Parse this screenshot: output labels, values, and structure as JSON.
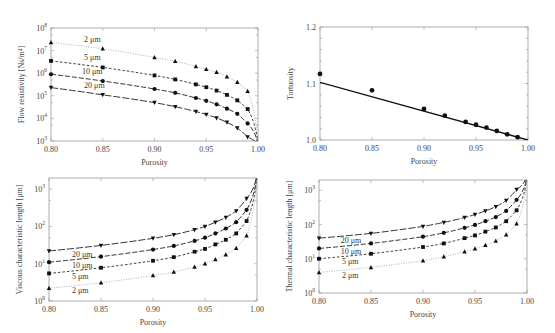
{
  "chart_data": [
    {
      "id": "flow_resistivity",
      "type": "line",
      "scale_y": "log",
      "title": "",
      "xlabel": "Porosity",
      "ylabel": "Flow resistivity [Ns/m⁴]",
      "xlim": [
        0.8,
        1.0
      ],
      "ylim_exp": [
        3,
        8
      ],
      "x_ticks": [
        "0.80",
        "0.85",
        "0.90",
        "0.95",
        "1.00"
      ],
      "y_ticks": [
        "10^3",
        "10^4",
        "10^5",
        "10^6",
        "10^7",
        "10^8"
      ],
      "grid": false,
      "box": {
        "left": 51,
        "top": 28,
        "right": 258,
        "bottom": 141
      },
      "series": [
        {
          "name": "2 μm",
          "marker": "triangle-up",
          "dash": "1,1.5",
          "color": "#aaaaaa",
          "x": [
            0.8,
            0.85,
            0.9,
            0.92,
            0.94,
            0.95,
            0.96,
            0.97,
            0.98,
            0.99
          ],
          "y": [
            23000000.0,
            12000000.0,
            5000000.0,
            3400000.0,
            2000000.0,
            1500000.0,
            1100000.0,
            700000.0,
            400000.0,
            160000.0
          ],
          "label_pos": [
            0.832,
            23000000.0
          ]
        },
        {
          "name": "5 μm",
          "marker": "square",
          "dash": "2.5,2",
          "color": "#333333",
          "x": [
            0.8,
            0.85,
            0.9,
            0.92,
            0.94,
            0.95,
            0.96,
            0.97,
            0.98,
            0.99
          ],
          "y": [
            3500000.0,
            1800000.0,
            800000.0,
            530000.0,
            320000.0,
            240000.0,
            170000.0,
            110000.0,
            63000.0,
            26000.0
          ],
          "label_pos": [
            0.832,
            3700000.0
          ]
        },
        {
          "name": "10 μm",
          "marker": "circle",
          "dash": "5,2",
          "color": "#333333",
          "x": [
            0.8,
            0.85,
            0.9,
            0.92,
            0.94,
            0.95,
            0.96,
            0.97,
            0.98,
            0.99
          ],
          "y": [
            900000.0,
            450000.0,
            200000.0,
            135000.0,
            80000.0,
            60000.0,
            42000.0,
            27000.0,
            16000.0,
            6000.0
          ],
          "label_pos": [
            0.83,
            900000.0
          ]
        },
        {
          "name": "20 μm",
          "marker": "triangle-down",
          "dash": "7,2",
          "color": "#333333",
          "x": [
            0.8,
            0.85,
            0.9,
            0.92,
            0.94,
            0.95,
            0.96,
            0.97,
            0.98,
            0.99
          ],
          "y": [
            230000.0,
            110000.0,
            50000.0,
            33000.0,
            20000.0,
            15000.0,
            10500.0,
            6700.0,
            3800.0,
            1500.0
          ],
          "label_pos": [
            0.832,
            230000.0
          ]
        }
      ]
    },
    {
      "id": "tortuosity",
      "type": "scatter",
      "scale_y": "linear",
      "title": "",
      "xlabel": "Porosity",
      "ylabel": "Tortuosity",
      "xlim": [
        0.8,
        1.0
      ],
      "ylim": [
        1.0,
        1.2
      ],
      "x_ticks": [
        "0.80",
        "0.85",
        "0.90",
        "0.95",
        "1.00"
      ],
      "y_ticks": [
        "1.0",
        "1.1",
        "1.2"
      ],
      "grid": false,
      "box": {
        "left": 320,
        "top": 27,
        "right": 528,
        "bottom": 140
      },
      "series": [
        {
          "name": "Simulation",
          "marker": "circle",
          "x": [
            0.8,
            0.85,
            0.9,
            0.92,
            0.94,
            0.95,
            0.96,
            0.97,
            0.98,
            0.99
          ],
          "y": [
            1.117,
            1.088,
            1.055,
            1.043,
            1.032,
            1.027,
            1.022,
            1.016,
            1.01,
            1.005
          ]
        },
        {
          "name": "Fit",
          "type": "line",
          "x": [
            0.8,
            1.0
          ],
          "y": [
            1.102,
            1.0
          ]
        }
      ]
    },
    {
      "id": "viscous_length",
      "type": "line",
      "scale_y": "log",
      "title": "",
      "xlabel": "Porosity",
      "ylabel": "Viscous characteristic length [μm]",
      "xlim": [
        0.8,
        1.0
      ],
      "ylim_exp": [
        0,
        3.3
      ],
      "x_ticks": [
        "0.80",
        "0.85",
        "0.90",
        "0.95",
        "1.00"
      ],
      "y_ticks": [
        "10^0",
        "10^1",
        "10^2",
        "10^3"
      ],
      "grid": false,
      "box": {
        "left": 49,
        "top": 178,
        "right": 257,
        "bottom": 301
      },
      "series": [
        {
          "name": "20 μm",
          "marker": "triangle-down",
          "dash": "7,2",
          "color": "#333333",
          "x": [
            0.8,
            0.85,
            0.9,
            0.92,
            0.94,
            0.95,
            0.96,
            0.97,
            0.98,
            0.99
          ],
          "y": [
            22,
            31,
            48,
            60,
            82,
            100,
            130,
            175,
            260,
            560
          ],
          "label_pos": [
            0.822,
            15.5
          ]
        },
        {
          "name": "10 μm",
          "marker": "circle",
          "dash": "5,2",
          "color": "#333333",
          "x": [
            0.8,
            0.85,
            0.9,
            0.92,
            0.94,
            0.95,
            0.96,
            0.97,
            0.98,
            0.99
          ],
          "y": [
            11,
            15.5,
            24,
            30,
            41,
            50,
            65,
            88,
            130,
            280
          ],
          "label_pos": [
            0.822,
            7.8
          ]
        },
        {
          "name": "5 μm",
          "marker": "square",
          "dash": "2.5,2",
          "color": "#333333",
          "x": [
            0.8,
            0.85,
            0.9,
            0.92,
            0.94,
            0.95,
            0.96,
            0.97,
            0.98,
            0.99
          ],
          "y": [
            5.5,
            7.8,
            12,
            15,
            21,
            25,
            33,
            44,
            65,
            140
          ],
          "label_pos": [
            0.822,
            3.9
          ]
        },
        {
          "name": "2 μm",
          "marker": "triangle-up",
          "dash": "1,1.5",
          "color": "#aaaaaa",
          "x": [
            0.8,
            0.85,
            0.9,
            0.92,
            0.94,
            0.95,
            0.96,
            0.97,
            0.98,
            0.99
          ],
          "y": [
            2.2,
            3.1,
            4.8,
            6.0,
            8.2,
            10,
            13,
            17.5,
            26,
            56
          ],
          "label_pos": [
            0.822,
            1.6
          ]
        }
      ]
    },
    {
      "id": "thermal_length",
      "type": "line",
      "scale_y": "log",
      "title": "",
      "xlabel": "Porosity",
      "ylabel": "Thermal characteristic length [μm]",
      "xlim": [
        0.8,
        1.0
      ],
      "ylim_exp": [
        0,
        3.3
      ],
      "x_ticks": [
        "0.80",
        "0.85",
        "0.90",
        "0.95",
        "1.00"
      ],
      "y_ticks": [
        "10^0",
        "10^1",
        "10^2",
        "10^3"
      ],
      "grid": false,
      "box": {
        "left": 319,
        "top": 180,
        "right": 527,
        "bottom": 293
      },
      "series": [
        {
          "name": "20 μm",
          "marker": "triangle-down",
          "dash": "7,2",
          "color": "#333333",
          "x": [
            0.8,
            0.85,
            0.9,
            0.92,
            0.94,
            0.95,
            0.96,
            0.97,
            0.98,
            0.99
          ],
          "y": [
            40,
            55,
            88,
            115,
            160,
            195,
            250,
            330,
            500,
            1050
          ],
          "label_pos": [
            0.821,
            28
          ]
        },
        {
          "name": "10 μm",
          "marker": "circle",
          "dash": "5,2",
          "color": "#333333",
          "x": [
            0.8,
            0.85,
            0.9,
            0.92,
            0.94,
            0.95,
            0.96,
            0.97,
            0.98,
            0.99
          ],
          "y": [
            20,
            28,
            44,
            57,
            80,
            97,
            125,
            165,
            250,
            525
          ],
          "label_pos": [
            0.821,
            14
          ]
        },
        {
          "name": "5 μm",
          "marker": "square",
          "dash": "2.5,2",
          "color": "#333333",
          "x": [
            0.8,
            0.85,
            0.9,
            0.92,
            0.94,
            0.95,
            0.96,
            0.97,
            0.98,
            0.99
          ],
          "y": [
            10,
            14,
            22,
            28,
            40,
            48,
            62,
            82,
            125,
            260
          ],
          "label_pos": [
            0.822,
            7
          ]
        },
        {
          "name": "2 μm",
          "marker": "triangle-up",
          "dash": "1,1.5",
          "color": "#aaaaaa",
          "x": [
            0.8,
            0.85,
            0.9,
            0.92,
            0.94,
            0.95,
            0.96,
            0.97,
            0.98,
            0.99
          ],
          "y": [
            4.0,
            5.6,
            8.8,
            11.5,
            16,
            19.5,
            25,
            33,
            50,
            105
          ],
          "label_pos": [
            0.822,
            2.8
          ]
        }
      ]
    }
  ]
}
